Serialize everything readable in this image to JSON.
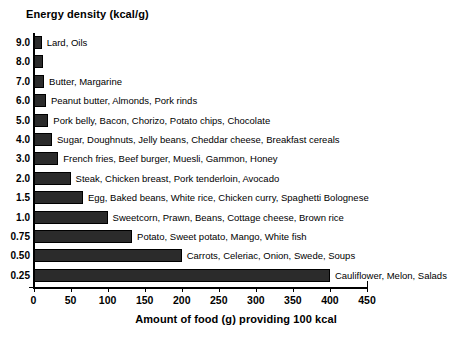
{
  "chart_data": {
    "type": "bar",
    "orientation": "horizontal",
    "title": "Energy density  (kcal/g)",
    "xlabel": "Amount of food (g) providing 100 kcal",
    "ylabel": "Energy density  (kcal/g)",
    "xlim": [
      0,
      450
    ],
    "xticks": [
      0,
      50,
      100,
      150,
      200,
      250,
      300,
      350,
      400,
      450
    ],
    "xticklabels": [
      "0",
      "50",
      "100",
      "150",
      "200",
      "250",
      "300",
      "350",
      "400",
      "450"
    ],
    "grid": false,
    "legend": "none",
    "bar_color": "#2b2b2b",
    "categories": [
      "9.0",
      "8.0",
      "7.0",
      "6.0",
      "5.0",
      "4.0",
      "3.0",
      "2.0",
      "1.5",
      "1.0",
      "0.75",
      "0.50",
      "0.25"
    ],
    "values": [
      11,
      12.5,
      14.3,
      16.7,
      20,
      25,
      33.3,
      50,
      66.7,
      100,
      133,
      200,
      400
    ],
    "annotations": [
      "Lard, Oils",
      "",
      "Butter, Margarine",
      "Peanut butter, Almonds, Pork rinds",
      "Pork belly, Bacon, Chorizo, Potato chips, Chocolate",
      "Sugar, Doughnuts, Jelly beans, Cheddar cheese, Breakfast cereals",
      "French fries, Beef burger, Muesli, Gammon, Honey",
      "Steak, Chicken breast, Pork tenderloin, Avocado",
      "Egg, Baked beans, White rice, Chicken curry, Spaghetti Bolognese",
      "Sweetcorn, Prawn, Beans, Cottage cheese, Brown rice",
      "Potato, Sweet potato, Mango, White fish",
      "Carrots, Celeriac, Onion, Swede, Soups",
      "Cauliflower, Melon, Salads"
    ]
  }
}
